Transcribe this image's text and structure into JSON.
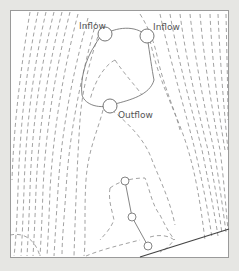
{
  "diagram": {
    "type": "contour-map",
    "labels": {
      "inflow_left": "Inflow",
      "inflow_right": "Inflow",
      "outflow": "Outflow"
    },
    "colors": {
      "background": "#e6e6e3",
      "plot": "#ffffff",
      "frame": "#9a9a9a",
      "contour": "#8a8a8a",
      "solid": "#777777",
      "boundary": "#444444"
    },
    "markers": [
      {
        "name": "inflow-left",
        "x": 105,
        "y": 34,
        "r": 7
      },
      {
        "name": "inflow-right",
        "x": 147,
        "y": 36,
        "r": 7
      },
      {
        "name": "outflow",
        "x": 110,
        "y": 106,
        "r": 7
      },
      {
        "name": "node-1",
        "x": 125,
        "y": 181,
        "r": 4
      },
      {
        "name": "node-2",
        "x": 132,
        "y": 217,
        "r": 4
      },
      {
        "name": "node-3",
        "x": 148,
        "y": 246,
        "r": 4
      }
    ]
  }
}
